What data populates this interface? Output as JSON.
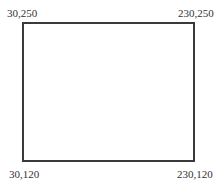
{
  "diagram": {
    "shape": "rectangle",
    "stroke_color": "#3a3a3a",
    "fill_color": "#ffffff",
    "corners": {
      "top_left": {
        "label": "30,250",
        "x": 30,
        "y": 250
      },
      "top_right": {
        "label": "230,250",
        "x": 230,
        "y": 250
      },
      "bottom_left": {
        "label": "30,120",
        "x": 30,
        "y": 120
      },
      "bottom_right": {
        "label": "230,120",
        "x": 230,
        "y": 120
      }
    }
  }
}
